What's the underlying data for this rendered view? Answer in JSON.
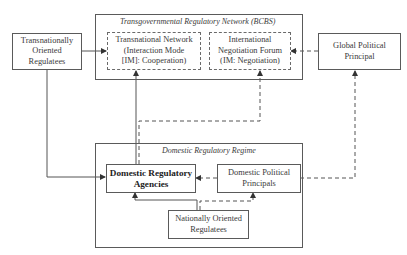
{
  "diagram": {
    "transgovernmental_network": {
      "title": "Transgovernmental Regulatory Network (BCBS)",
      "transnational_network": "Transnational Network\n(Interaction Mode\n[IM]: Cooperation)",
      "negotiation_forum": "International\nNegotiation Forum\n(IM: Negotiation)"
    },
    "transnational_regulatees": "Transnationally\nOriented\nRegulatees",
    "global_political_principal": "Global Political\nPrincipal",
    "domestic_regime": {
      "title": "Domestic Regulatory Regime",
      "agencies": "Domestic Regulatory\nAgencies",
      "political_principals": "Domestic Political\nPrincipals",
      "national_regulatees": "Nationally Oriented\nRegulatees"
    },
    "edges": [
      {
        "from": "Transnationally Oriented Regulatees",
        "to": "Transnational Network",
        "style": "solid"
      },
      {
        "from": "Transnationally Oriented Regulatees",
        "to": "Domestic Regulatory Agencies",
        "style": "solid"
      },
      {
        "from": "Domestic Regulatory Agencies",
        "to": "Transnational Network",
        "style": "solid"
      },
      {
        "from": "Domestic Regulatory Agencies",
        "to": "International Negotiation Forum",
        "style": "dashed"
      },
      {
        "from": "Global Political Principal",
        "to": "International Negotiation Forum",
        "style": "dashed"
      },
      {
        "from": "Domestic Political Principals",
        "to": "Global Political Principal",
        "style": "dashed"
      },
      {
        "from": "Domestic Political Principals",
        "to": "Domestic Regulatory Agencies",
        "style": "dashed"
      },
      {
        "from": "Nationally Oriented Regulatees",
        "to": "Domestic Regulatory Agencies",
        "style": "solid"
      },
      {
        "from": "Nationally Oriented Regulatees",
        "to": "Domestic Political Principals",
        "style": "dashed"
      }
    ]
  }
}
